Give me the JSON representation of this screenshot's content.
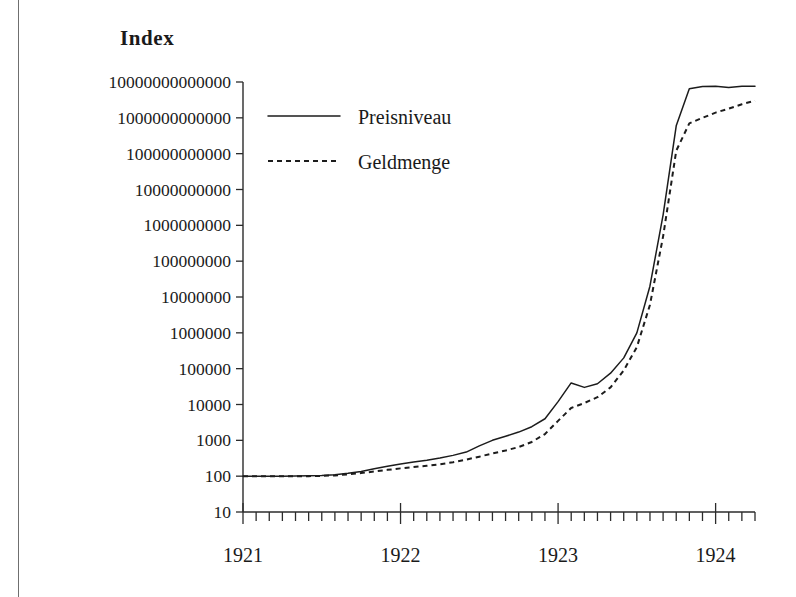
{
  "figure": {
    "axis_title": "Index",
    "background": "#ffffff",
    "ink_color": "#1c1c1c"
  },
  "legend": {
    "position": "top-left-inside",
    "entries": [
      {
        "label": "Preisniveau",
        "style": "solid",
        "marker": "line-solid-icon"
      },
      {
        "label": "Geldmenge",
        "style": "dotted",
        "marker": "line-dotted-icon"
      }
    ]
  },
  "chart_data": {
    "type": "line",
    "title": "Index",
    "xlabel": "",
    "ylabel": "Index",
    "yscale": "log",
    "ylim": [
      10,
      10000000000000
    ],
    "grid": false,
    "legend_position": "top-left-inside",
    "ytick_labels": [
      "10000000000000",
      "1000000000000",
      "100000000000",
      "10000000000",
      "1000000000",
      "100000000",
      "10000000",
      "1000000",
      "100000",
      "10000",
      "1000",
      "100",
      "10"
    ],
    "ytick_values": [
      10000000000000.0,
      1000000000000.0,
      100000000000.0,
      10000000000.0,
      1000000000.0,
      100000000.0,
      10000000.0,
      1000000.0,
      100000,
      10000,
      1000,
      100,
      10
    ],
    "xtick_labels": [
      "1921",
      "1922",
      "1923",
      "1924"
    ],
    "xtick_values": [
      1921.0,
      1922.0,
      1923.0,
      1924.0
    ],
    "xlim": [
      1921.0,
      1924.25
    ],
    "x_minor_tick_interval_months": 1,
    "x": [
      1921.0,
      1921.083,
      1921.167,
      1921.25,
      1921.333,
      1921.417,
      1921.5,
      1921.583,
      1921.667,
      1921.75,
      1921.833,
      1921.917,
      1922.0,
      1922.083,
      1922.167,
      1922.25,
      1922.333,
      1922.417,
      1922.5,
      1922.583,
      1922.667,
      1922.75,
      1922.833,
      1922.917,
      1923.0,
      1923.083,
      1923.167,
      1923.25,
      1923.333,
      1923.417,
      1923.5,
      1923.583,
      1923.667,
      1923.75,
      1923.833,
      1923.917,
      1924.0,
      1924.083,
      1924.167,
      1924.25
    ],
    "series": [
      {
        "name": "Preisniveau",
        "style": "solid",
        "values": [
          100,
          100,
          100,
          100,
          101,
          102,
          104,
          110,
          120,
          135,
          160,
          190,
          220,
          250,
          280,
          320,
          380,
          470,
          700,
          1000,
          1300,
          1700,
          2400,
          4000,
          12000,
          40000,
          30000,
          38000,
          75000,
          200000,
          1000000,
          20000000,
          2000000000,
          600000000000,
          6500000000000,
          7500000000000,
          7600000000000,
          7000000000000,
          7600000000000,
          7600000000000
        ]
      },
      {
        "name": "Geldmenge",
        "style": "dotted",
        "values": [
          100,
          100,
          100,
          100,
          100,
          100,
          102,
          105,
          112,
          122,
          135,
          150,
          165,
          180,
          195,
          215,
          245,
          290,
          350,
          430,
          520,
          650,
          900,
          1500,
          3500,
          8000,
          11000,
          16000,
          30000,
          90000,
          400000,
          6000000,
          500000000,
          120000000000,
          700000000000,
          1000000000000,
          1400000000000,
          1800000000000,
          2400000000000,
          3000000000000
        ]
      }
    ],
    "annotations": []
  }
}
